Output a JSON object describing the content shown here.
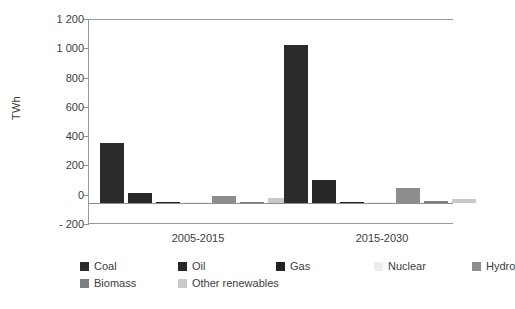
{
  "chart_data": {
    "type": "bar",
    "title": "",
    "subtitle": "",
    "xlabel": "",
    "ylabel": "TWh",
    "ylim": [
      -200,
      1200
    ],
    "yticks": [
      1200,
      1000,
      800,
      600,
      400,
      200,
      0,
      -200
    ],
    "ytick_labels": [
      "1 200",
      "1 000",
      "800",
      "600",
      "400",
      "200",
      "0",
      "- 200"
    ],
    "grid": false,
    "legend_position": "bottom-left",
    "categories": [
      "2005-2015",
      "2015-2030"
    ],
    "series": [
      {
        "name": "Coal",
        "color": "#2b2b2b",
        "values": [
          410,
          1080
        ]
      },
      {
        "name": "Oil",
        "color": "#272727",
        "values": [
          70,
          160
        ]
      },
      {
        "name": "Gas",
        "color": "#232323",
        "values": [
          8,
          10
        ]
      },
      {
        "name": "Nuclear",
        "color": "#ececec",
        "values": [
          5,
          8
        ]
      },
      {
        "name": "Hydro",
        "color": "#8d8d8d",
        "values": [
          50,
          100
        ]
      },
      {
        "name": "Biomass",
        "color": "#7d7d7d",
        "values": [
          4,
          12
        ]
      },
      {
        "name": "Other renewables",
        "color": "#c9c9c9",
        "values": [
          35,
          30
        ]
      }
    ]
  },
  "legend": {
    "row1": [
      "Coal",
      "Oil",
      "Gas",
      "Nuclear",
      "Hydro"
    ],
    "row2": [
      "Biomass",
      "Other renewables"
    ]
  }
}
